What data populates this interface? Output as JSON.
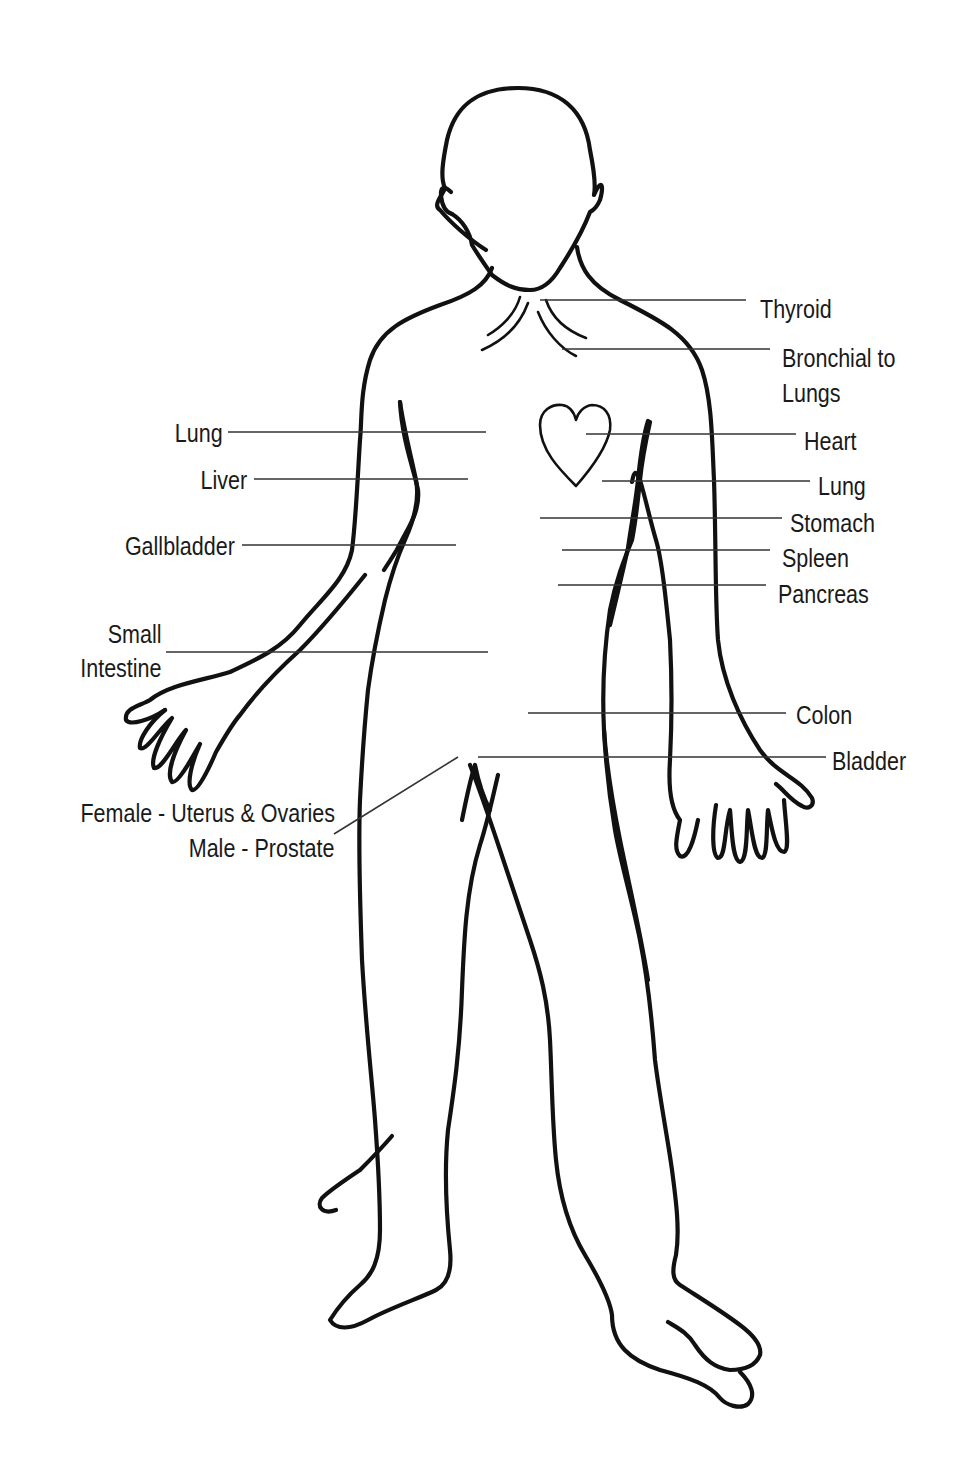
{
  "diagram": {
    "colors": {
      "background": "#ffffff",
      "outline": "#111111",
      "leader_line": "#333333",
      "text": "#1a1a1a"
    },
    "labels_right": [
      {
        "id": "thyroid",
        "text": "Thyroid"
      },
      {
        "id": "bronchial",
        "line1": "Bronchial to",
        "line2": "Lungs"
      },
      {
        "id": "heart",
        "text": "Heart"
      },
      {
        "id": "lung-right",
        "text": "Lung"
      },
      {
        "id": "stomach",
        "text": "Stomach"
      },
      {
        "id": "spleen",
        "text": "Spleen"
      },
      {
        "id": "pancreas",
        "text": "Pancreas"
      },
      {
        "id": "colon",
        "text": "Colon"
      },
      {
        "id": "bladder",
        "text": "Bladder"
      }
    ],
    "labels_left": [
      {
        "id": "lung-left",
        "text": "Lung"
      },
      {
        "id": "liver",
        "text": "Liver"
      },
      {
        "id": "gallbladder",
        "text": "Gallbladder"
      },
      {
        "id": "small-intestine",
        "line1": "Small",
        "line2": "Intestine"
      },
      {
        "id": "reproductive",
        "line1": "Female - Uterus & Ovaries",
        "line2": "Male - Prostate"
      }
    ]
  }
}
